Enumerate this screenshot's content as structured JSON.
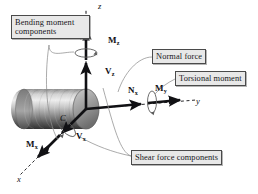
{
  "figure": {
    "background_color": "#ffffff"
  },
  "callouts": [
    {
      "id": "bending",
      "name": "callout-bending-moment-components",
      "text": "Bending moment\ncomponents",
      "box_color": "#e8e8e8",
      "border_color": "#4a4a4a"
    },
    {
      "id": "normal",
      "name": "callout-normal-force",
      "text": "Normal force",
      "box_color": "#e8e8e8",
      "border_color": "#4a4a4a"
    },
    {
      "id": "torsional",
      "name": "callout-torsional-moment",
      "text": "Torsional moment",
      "box_color": "#e8e8e8",
      "border_color": "#4a4a4a"
    },
    {
      "id": "shear",
      "name": "callout-shear-force-components",
      "text": "Shear force components",
      "box_color": "#e8e8e8",
      "border_color": "#4a4a4a"
    }
  ],
  "vectors": [
    {
      "id": "Mz",
      "base": "M",
      "sub": "z",
      "kind": "moment",
      "description": "bending moment about z"
    },
    {
      "id": "Vz",
      "base": "V",
      "sub": "z",
      "kind": "force",
      "description": "shear force along z"
    },
    {
      "id": "Nx",
      "base": "N",
      "sub": "x",
      "kind": "force",
      "description": "normal force"
    },
    {
      "id": "My",
      "base": "M",
      "sub": "y",
      "kind": "moment",
      "description": "torsional moment about y"
    },
    {
      "id": "Vy",
      "base": "V",
      "sub": "x",
      "kind": "force",
      "description": "shear force along x"
    },
    {
      "id": "Mx",
      "base": "M",
      "sub": "x",
      "kind": "moment",
      "description": "bending moment about x"
    }
  ],
  "axes": [
    {
      "id": "z",
      "label": "z",
      "direction": "up"
    },
    {
      "id": "y",
      "label": "y",
      "direction": "right"
    },
    {
      "id": "x",
      "label": "x",
      "direction": "lower-left"
    }
  ],
  "centroid": {
    "label": "C",
    "description": "centroid of cross section"
  },
  "colors": {
    "stroke": "#111114",
    "leader_line": "#8a8a8a",
    "cylinder_light": "#e4e4e4",
    "cylinder_mid": "#9b9b9b",
    "cylinder_dark": "#3a3a3a",
    "cap_fill": "#a9a9a9",
    "callout_fill": "#e8e8e8",
    "callout_border": "#4a4a4a"
  }
}
